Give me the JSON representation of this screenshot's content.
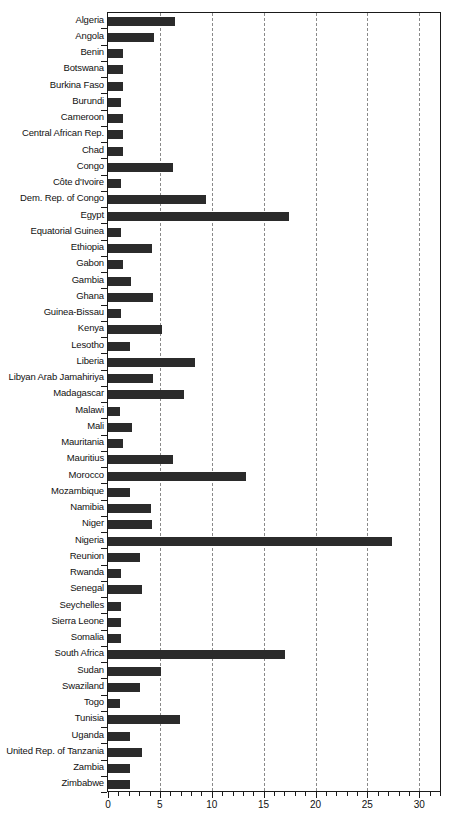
{
  "chart_data": {
    "type": "bar",
    "orientation": "horizontal",
    "title": "",
    "subtitle": "",
    "xlabel": "",
    "ylabel": "",
    "xlim": [
      0,
      32
    ],
    "ylim": null,
    "grid": true,
    "grid_axis": "x",
    "grid_style": "dashed",
    "legend": null,
    "legend_position": "none",
    "bar_color": "#2b2b2b",
    "background_color": "#ffffff",
    "axis_color": "#1a1a1a",
    "xticks": [
      0,
      5,
      10,
      15,
      20,
      25,
      30
    ],
    "xtick_labels": [
      "0",
      "5",
      "10",
      "15",
      "20",
      "25",
      "30"
    ],
    "xtick_minor_step": 1,
    "categories": [
      "Algeria",
      "Angola",
      "Benin",
      "Botswana",
      "Burkina Faso",
      "Burundi",
      "Cameroon",
      "Central African Rep.",
      "Chad",
      "Congo",
      "Côte d'Ivoire",
      "Dem. Rep. of Congo",
      "Egypt",
      "Equatorial Guinea",
      "Ethiopia",
      "Gabon",
      "Gambia",
      "Ghana",
      "Guinea-Bissau",
      "Kenya",
      "Lesotho",
      "Liberia",
      "Libyan Arab Jamahiriya",
      "Madagascar",
      "Malawi",
      "Mali",
      "Mauritania",
      "Mauritius",
      "Morocco",
      "Mozambique",
      "Namibia",
      "Niger",
      "Nigeria",
      "Reunion",
      "Rwanda",
      "Senegal",
      "Seychelles",
      "Sierra Leone",
      "Somalia",
      "South Africa",
      "Sudan",
      "Swaziland",
      "Togo",
      "Tunisia",
      "Uganda",
      "United Rep. of Tanzania",
      "Zambia",
      "Zimbabwe"
    ],
    "values": [
      6.5,
      4.4,
      1.4,
      1.4,
      1.4,
      1.3,
      1.4,
      1.4,
      1.4,
      6.3,
      1.3,
      9.4,
      17.4,
      1.3,
      4.2,
      1.4,
      2.2,
      4.3,
      1.3,
      5.2,
      2.1,
      8.4,
      4.3,
      7.3,
      1.2,
      2.3,
      1.4,
      6.3,
      13.3,
      2.1,
      4.1,
      4.2,
      27.4,
      3.1,
      1.3,
      3.3,
      1.3,
      1.3,
      1.3,
      17.1,
      5.1,
      3.1,
      1.2,
      6.9,
      2.1,
      3.3,
      2.1,
      2.1
    ]
  }
}
